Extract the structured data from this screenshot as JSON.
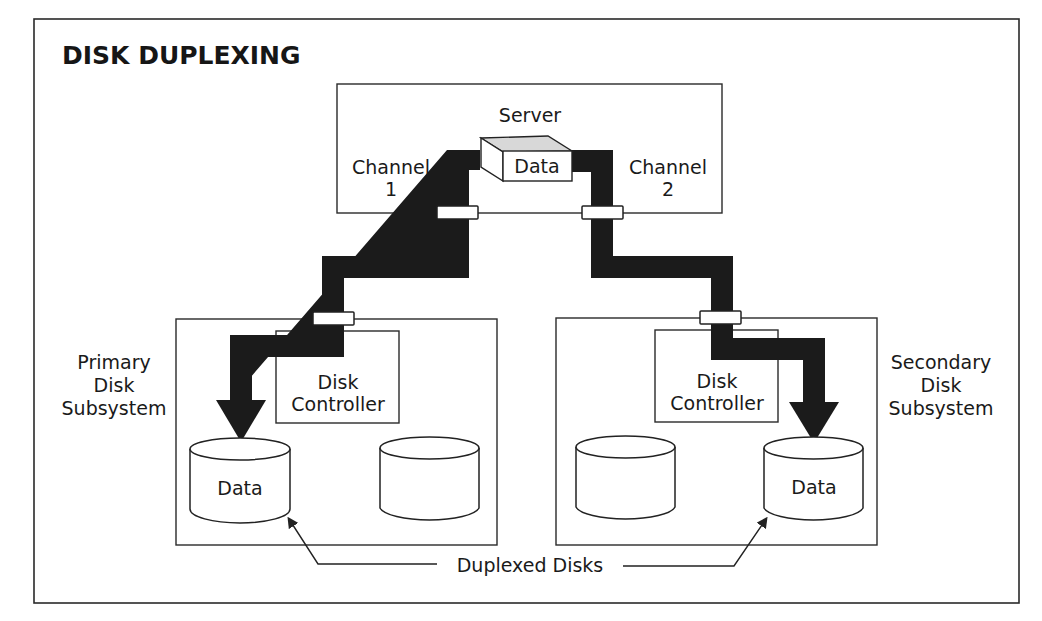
{
  "title": "DISK DUPLEXING",
  "server": {
    "label": "Server",
    "data_block_label": "Data"
  },
  "channels": [
    {
      "line1": "Channel",
      "line2": "1"
    },
    {
      "line1": "Channel",
      "line2": "2"
    }
  ],
  "primary_subsystem": {
    "label_lines": [
      "Primary",
      "Disk",
      "Subsystem"
    ],
    "controller_lines": [
      "Disk",
      "Controller"
    ],
    "disks": [
      {
        "label": "Data"
      },
      {
        "label": ""
      }
    ]
  },
  "secondary_subsystem": {
    "label_lines": [
      "Secondary",
      "Disk",
      "Subsystem"
    ],
    "controller_lines": [
      "Disk",
      "Controller"
    ],
    "disks": [
      {
        "label": ""
      },
      {
        "label": "Data"
      }
    ]
  },
  "callout": "Duplexed Disks",
  "colors": {
    "ink": "#1b1b1b",
    "background": "#ffffff",
    "data_block_top": "#d8d8d8"
  }
}
